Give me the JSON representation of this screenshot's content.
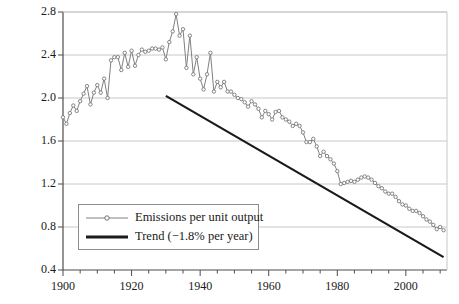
{
  "chart_data": {
    "type": "line",
    "title": "",
    "xlabel": "",
    "ylabel": "CO2 emissions/GDP (tons per 1000$ GDP, 2005$)",
    "ylabel_line1": "CO",
    "ylabel_line1_sub": "2",
    "ylabel_line1_rest": " emissions/GDP",
    "ylabel_line2": "(tons per 1000$ GDP, 2005$)",
    "xlim": [
      1900,
      2012
    ],
    "ylim": [
      0.4,
      2.8
    ],
    "yticks": [
      0.4,
      0.8,
      1.2,
      1.6,
      2.0,
      2.4,
      2.8
    ],
    "ytick_labels": [
      "0.4",
      "0.8",
      "1.2",
      "1.6",
      "2.0",
      "2.4",
      "2.8"
    ],
    "xticks": [
      1900,
      1920,
      1940,
      1960,
      1980,
      2000
    ],
    "xtick_labels": [
      "1900",
      "1920",
      "1940",
      "1960",
      "1980",
      "2000"
    ],
    "xminor_step": 5,
    "grid": "horizontal",
    "legend_position": "lower-left",
    "series": [
      {
        "name": "Emissions per unit output",
        "style": "line-with-markers",
        "color": "#808080",
        "x": [
          1900,
          1901,
          1902,
          1903,
          1904,
          1905,
          1906,
          1907,
          1908,
          1909,
          1910,
          1911,
          1912,
          1913,
          1914,
          1915,
          1916,
          1917,
          1918,
          1919,
          1920,
          1921,
          1922,
          1923,
          1924,
          1925,
          1926,
          1927,
          1928,
          1929,
          1930,
          1931,
          1932,
          1933,
          1934,
          1935,
          1936,
          1937,
          1938,
          1939,
          1940,
          1941,
          1942,
          1943,
          1944,
          1945,
          1946,
          1947,
          1948,
          1949,
          1950,
          1951,
          1952,
          1953,
          1954,
          1955,
          1956,
          1957,
          1958,
          1959,
          1960,
          1961,
          1962,
          1963,
          1964,
          1965,
          1966,
          1967,
          1968,
          1969,
          1970,
          1971,
          1972,
          1973,
          1974,
          1975,
          1976,
          1977,
          1978,
          1979,
          1980,
          1981,
          1982,
          1983,
          1984,
          1985,
          1986,
          1987,
          1988,
          1989,
          1990,
          1991,
          1992,
          1993,
          1994,
          1995,
          1996,
          1997,
          1998,
          1999,
          2000,
          2001,
          2002,
          2003,
          2004,
          2005,
          2006,
          2007,
          2008,
          2009,
          2010,
          2011
        ],
        "values": [
          1.82,
          1.76,
          1.86,
          1.93,
          1.88,
          1.97,
          2.04,
          2.11,
          1.94,
          2.05,
          2.12,
          2.05,
          2.18,
          2.0,
          2.35,
          2.38,
          2.38,
          2.26,
          2.42,
          2.29,
          2.44,
          2.3,
          2.4,
          2.45,
          2.43,
          2.44,
          2.46,
          2.46,
          2.45,
          2.47,
          2.36,
          2.52,
          2.62,
          2.78,
          2.58,
          2.64,
          2.28,
          2.58,
          2.22,
          2.38,
          2.18,
          2.08,
          2.22,
          2.42,
          2.06,
          2.15,
          2.1,
          2.15,
          2.06,
          2.06,
          2.03,
          2.0,
          1.99,
          1.96,
          1.92,
          1.97,
          1.94,
          1.9,
          1.82,
          1.88,
          1.85,
          1.8,
          1.87,
          1.88,
          1.82,
          1.8,
          1.78,
          1.74,
          1.76,
          1.74,
          1.68,
          1.59,
          1.59,
          1.62,
          1.55,
          1.46,
          1.5,
          1.46,
          1.43,
          1.39,
          1.32,
          1.2,
          1.21,
          1.22,
          1.23,
          1.22,
          1.24,
          1.26,
          1.27,
          1.26,
          1.24,
          1.21,
          1.18,
          1.16,
          1.13,
          1.11,
          1.11,
          1.08,
          1.04,
          1.01,
          1.0,
          0.97,
          0.95,
          0.95,
          0.93,
          0.9,
          0.87,
          0.85,
          0.82,
          0.78,
          0.8,
          0.77
        ]
      },
      {
        "name": "Trend (-1.8% per year)",
        "style": "line",
        "color": "#1a1a1a",
        "x": [
          1930,
          2011
        ],
        "values": [
          2.02,
          0.52
        ]
      }
    ],
    "legend_entries": [
      {
        "label": "Emissions per unit output",
        "marker": "circle",
        "color": "#808080"
      },
      {
        "label": "Trend (−1.8% per year)",
        "marker": "thick-line",
        "color": "#1a1a1a"
      }
    ]
  },
  "colors": {
    "axis": "#4d4d4d",
    "grid": "#c8c8c8",
    "series": "#808080",
    "trend": "#1a1a1a",
    "text": "#1a1a1a",
    "background": "#ffffff"
  }
}
